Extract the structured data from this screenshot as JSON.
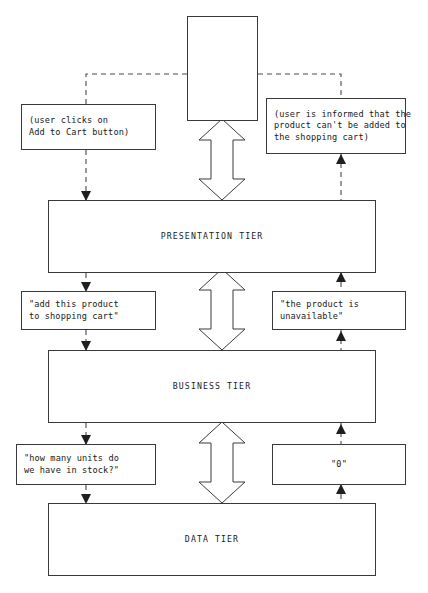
{
  "diagram": {
    "line_color": "#3a3a3a",
    "background": "#ffffff",
    "actor": {
      "name": "user-actor",
      "label": ""
    },
    "notes": [
      {
        "id": "note-click",
        "text": "(user clicks on\nAdd to Cart button)",
        "align": "left"
      },
      {
        "id": "note-inform",
        "text": "(user is informed that the\nproduct can't be added to\nthe shopping cart)",
        "align": "left"
      },
      {
        "id": "note-add",
        "text": "\"add this product\nto shopping cart\"",
        "align": "left"
      },
      {
        "id": "note-unavail",
        "text": "\"the product is\nunavailable\"",
        "align": "left"
      },
      {
        "id": "note-howmany",
        "text": "\"how many units do\nwe have in stock?\"",
        "align": "left"
      },
      {
        "id": "note-zero",
        "text": "\"0\"",
        "align": "center"
      }
    ],
    "tiers": [
      {
        "id": "tier-pres",
        "label": "PRESENTATION TIER"
      },
      {
        "id": "tier-bus",
        "label": "BUSINESS TIER"
      },
      {
        "id": "tier-data",
        "label": "DATA TIER"
      }
    ],
    "connectors": {
      "request_flow_label": "",
      "response_flow_label": "",
      "bidirectional_arrows": 3
    }
  }
}
